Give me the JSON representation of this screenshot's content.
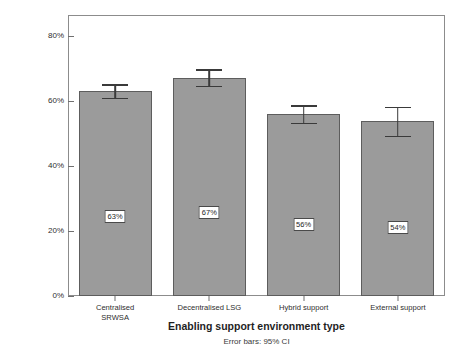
{
  "chart_data": {
    "type": "bar",
    "title": "",
    "subtitle": "",
    "categories": [
      "Centralised\nSRWSA",
      "Decentralised LSG",
      "Hybrid support",
      "External support"
    ],
    "values": [
      63,
      67,
      56,
      54
    ],
    "value_labels": [
      "63%",
      "67%",
      "56%",
      "54%"
    ],
    "error_bars": {
      "type": "95% CI",
      "lower": [
        60.5,
        64.2,
        52.8,
        48.8
      ],
      "upper": [
        64.8,
        69.3,
        58.3,
        57.8
      ]
    },
    "xlabel": "Enabling support environment type",
    "ylabel": "Percentage of households meeting basic or above on composite service-level in indicator (%)",
    "ylabel_line1": "Percentage of households meeting basic or above on",
    "ylabel_line2": "composite service-level in indicator (%)",
    "ytick_labels": [
      "0%",
      "20%",
      "40%",
      "60%",
      "80%"
    ],
    "ytick_values": [
      0,
      20,
      40,
      60,
      80
    ],
    "ylim": [
      0,
      86.5
    ],
    "grid": false,
    "legend": "none",
    "footnote": "Error bars: 95% CI",
    "bar_color": "#9b9b9b",
    "bar_edge_color": "#5d5d5d",
    "error_bar_color": "#3a3a3a",
    "frame_color": "#8c8c8c",
    "background": "#ffffff"
  }
}
